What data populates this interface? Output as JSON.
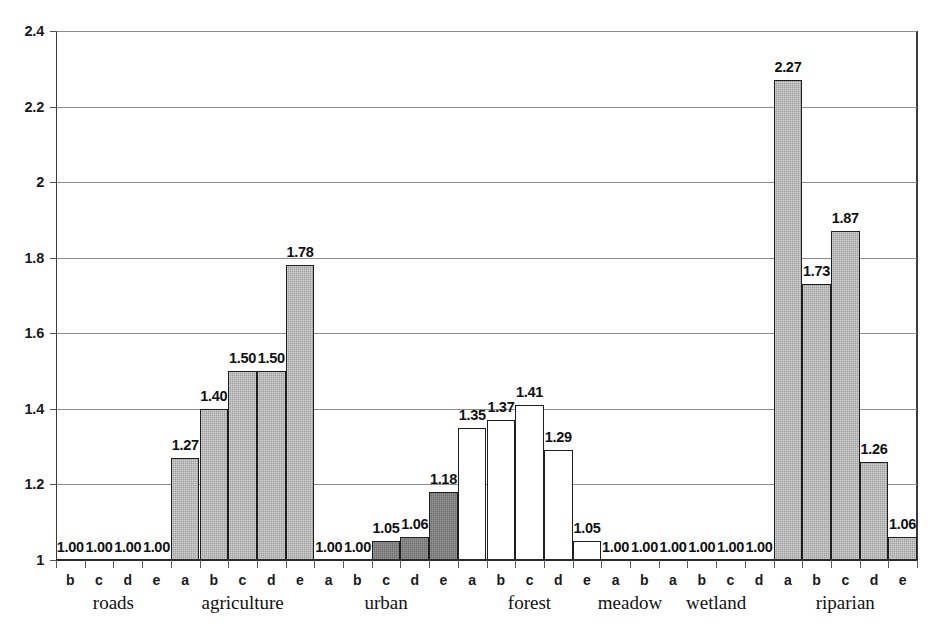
{
  "chart_data": {
    "type": "bar",
    "title": "",
    "subtitle": "",
    "xlabel": "",
    "ylabel": "",
    "ylim": [
      1,
      2.4
    ],
    "ytick_labels": [
      "1",
      "1.2",
      "1.4",
      "1.6",
      "1.8",
      "2",
      "2.2",
      "2.4"
    ],
    "ytick_values": [
      1,
      1.2,
      1.4,
      1.6,
      1.8,
      2.0,
      2.2,
      2.4
    ],
    "grid": true,
    "legend": "none",
    "baseline": 1,
    "groups": [
      {
        "name": "roads",
        "categories": [
          "b",
          "c",
          "d",
          "e"
        ],
        "values": [
          1.0,
          1.0,
          1.0,
          1.0
        ],
        "labels": [
          "1.00",
          "1.00",
          "1.00",
          "1.00"
        ],
        "fill": "light"
      },
      {
        "name": "agriculture",
        "categories": [
          "a",
          "b",
          "c",
          "d",
          "e"
        ],
        "values": [
          1.27,
          1.4,
          1.5,
          1.5,
          1.78
        ],
        "labels": [
          "1.27",
          "1.40",
          "1.50",
          "1.50",
          "1.78"
        ],
        "fill": "light"
      },
      {
        "name": "urban",
        "categories": [
          "a",
          "b",
          "c",
          "d",
          "e"
        ],
        "values": [
          1.0,
          1.0,
          1.05,
          1.06,
          1.18
        ],
        "labels": [
          "1.00",
          "1.00",
          "1.05",
          "1.06",
          "1.18"
        ],
        "fill": "dark"
      },
      {
        "name": "forest",
        "categories": [
          "a",
          "b",
          "c",
          "d",
          "e"
        ],
        "values": [
          1.35,
          1.37,
          1.41,
          1.29,
          1.05
        ],
        "labels": [
          "1.35",
          "1.37",
          "1.41",
          "1.29",
          "1.05"
        ],
        "fill": "white"
      },
      {
        "name": "meadow",
        "categories": [
          "a",
          "b"
        ],
        "values": [
          1.0,
          1.0
        ],
        "labels": [
          "1.00",
          "1.00"
        ],
        "fill": "white"
      },
      {
        "name": "wetland",
        "categories": [
          "a",
          "b",
          "c",
          "d"
        ],
        "values": [
          1.0,
          1.0,
          1.0,
          1.0
        ],
        "labels": [
          "1.00",
          "1.00",
          "1.00",
          "1.00"
        ],
        "fill": "white"
      },
      {
        "name": "riparian",
        "categories": [
          "a",
          "b",
          "c",
          "d",
          "e"
        ],
        "values": [
          2.27,
          1.73,
          1.87,
          1.26,
          1.06
        ],
        "labels": [
          "2.27",
          "1.73",
          "1.87",
          "1.26",
          "1.06"
        ],
        "fill": "light"
      }
    ],
    "colors": {
      "fill_light": "#9e9e9e",
      "fill_dark": "#6f6f6f",
      "fill_white": "#ffffff",
      "bar_outline": "#1e1e1e",
      "gridline": "#8d8d8d",
      "axis": "#2b2b2b",
      "text": "#111111",
      "background": "#ffffff"
    }
  }
}
